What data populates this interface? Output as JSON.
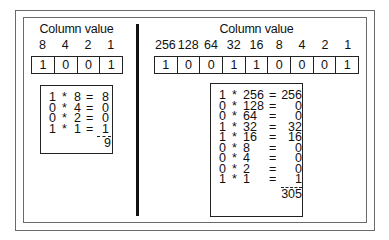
{
  "left": {
    "caption": "Column value",
    "column_values": [
      "8",
      "4",
      "2",
      "1"
    ],
    "bits": [
      "1",
      "0",
      "0",
      "1"
    ],
    "calc_rows": [
      {
        "bit": "1",
        "op": "*",
        "col": "8",
        "eq": "=",
        "result": "8"
      },
      {
        "bit": "0",
        "op": "*",
        "col": "4",
        "eq": "=",
        "result": "0"
      },
      {
        "bit": "0",
        "op": "*",
        "col": "2",
        "eq": "=",
        "result": "0"
      },
      {
        "bit": "1",
        "op": "*",
        "col": "1",
        "eq": "=",
        "result": "1"
      }
    ],
    "total": "9"
  },
  "right": {
    "caption": "Column value",
    "column_values": [
      "256",
      "128",
      "64",
      "32",
      "16",
      "8",
      "4",
      "2",
      "1"
    ],
    "bits": [
      "1",
      "0",
      "0",
      "1",
      "1",
      "0",
      "0",
      "0",
      "1"
    ],
    "calc_rows": [
      {
        "bit": "1",
        "op": "*",
        "col": "256",
        "eq": "=",
        "result": "256"
      },
      {
        "bit": "0",
        "op": "*",
        "col": "128",
        "eq": "=",
        "result": "0"
      },
      {
        "bit": "0",
        "op": "*",
        "col": "64",
        "eq": "=",
        "result": "0"
      },
      {
        "bit": "1",
        "op": "*",
        "col": "32",
        "eq": "=",
        "result": "32"
      },
      {
        "bit": "1",
        "op": "*",
        "col": "16",
        "eq": "=",
        "result": "16"
      },
      {
        "bit": "0",
        "op": "*",
        "col": "8",
        "eq": "=",
        "result": "0"
      },
      {
        "bit": "0",
        "op": "*",
        "col": "4",
        "eq": "=",
        "result": "0"
      },
      {
        "bit": "0",
        "op": "*",
        "col": "2",
        "eq": "=",
        "result": "0"
      },
      {
        "bit": "1",
        "op": "*",
        "col": "1",
        "eq": "=",
        "result": "1"
      }
    ],
    "total": "305"
  }
}
